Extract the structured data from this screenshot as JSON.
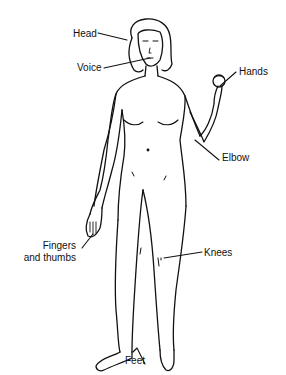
{
  "diagram": {
    "line_color": "#111111",
    "background": "#ffffff",
    "labels": [
      {
        "id": "head",
        "text": "Head"
      },
      {
        "id": "voice",
        "text": "Voice"
      },
      {
        "id": "hands",
        "text": "Hands"
      },
      {
        "id": "elbow",
        "text": "Elbow"
      },
      {
        "id": "fingers_line1",
        "text": "Fingers"
      },
      {
        "id": "fingers_line2",
        "text": "and thumbs"
      },
      {
        "id": "knees",
        "text": "Knees"
      },
      {
        "id": "feet",
        "text": "Feet"
      }
    ]
  }
}
